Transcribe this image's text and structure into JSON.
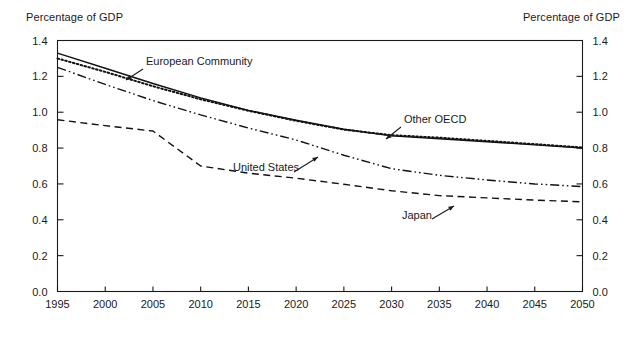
{
  "labels": {
    "ylabel_left": "Percentage of GDP",
    "ylabel_right": "Percentage of GDP"
  },
  "chart_data": {
    "type": "line",
    "title": "",
    "xlabel": "",
    "ylabel": "Percentage of GDP",
    "ylabel_right": "Percentage of GDP",
    "xlim": [
      1995,
      2050
    ],
    "ylim": [
      0.0,
      1.4
    ],
    "grid": false,
    "legend": "annotations-on-plot",
    "xticks": [
      1995,
      2000,
      2005,
      2010,
      2015,
      2020,
      2025,
      2030,
      2035,
      2040,
      2045,
      2050
    ],
    "xtick_labels": [
      "1995",
      "2000",
      "2005",
      "2010",
      "2015",
      "2020",
      "2025",
      "2030",
      "2035",
      "2040",
      "2045",
      "2050"
    ],
    "yticks": [
      0.0,
      0.2,
      0.4,
      0.6,
      0.8,
      1.0,
      1.2,
      1.4
    ],
    "ytick_labels": [
      "0.0",
      "0.2",
      "0.4",
      "0.6",
      "0.8",
      "1.0",
      "1.2",
      "1.4"
    ],
    "x": [
      1995,
      2000,
      2005,
      2010,
      2015,
      2020,
      2025,
      2030,
      2035,
      2040,
      2045,
      2050
    ],
    "series": [
      {
        "name": "European Community",
        "style": "solid",
        "values": [
          1.33,
          1.245,
          1.16,
          1.08,
          1.01,
          0.955,
          0.905,
          0.868,
          0.852,
          0.835,
          0.818,
          0.8
        ]
      },
      {
        "name": "Other OECD",
        "style": "dotted",
        "values": [
          1.3,
          1.225,
          1.145,
          1.072,
          1.008,
          0.952,
          0.903,
          0.872,
          0.858,
          0.84,
          0.822,
          0.803
        ]
      },
      {
        "name": "United States",
        "style": "dash-dot-dot",
        "values": [
          1.25,
          1.155,
          1.065,
          0.985,
          0.912,
          0.845,
          0.76,
          0.685,
          0.648,
          0.622,
          0.6,
          0.585
        ]
      },
      {
        "name": "Japan",
        "style": "dashed",
        "values": [
          0.958,
          0.925,
          0.895,
          0.7,
          0.66,
          0.632,
          0.598,
          0.562,
          0.535,
          0.522,
          0.51,
          0.5
        ]
      }
    ],
    "annotations": [
      {
        "text": "European Community",
        "label_x": 146,
        "label_y": 65,
        "arrow_from_x": 143,
        "arrow_from_y": 69,
        "arrow_to_x": 126,
        "arrow_to_y": 80,
        "series": "European Community"
      },
      {
        "text": "Other OECD",
        "label_x": 404,
        "label_y": 123,
        "arrow_from_x": 401,
        "arrow_from_y": 127,
        "arrow_to_x": 386,
        "arrow_to_y": 139,
        "series": "Other OECD"
      },
      {
        "text": "United States",
        "label_x": 233,
        "label_y": 171,
        "arrow_from_x": 294,
        "arrow_from_y": 172,
        "arrow_to_x": 318,
        "arrow_to_y": 157,
        "series": "United States"
      },
      {
        "text": "Japan",
        "label_x": 402,
        "label_y": 219,
        "arrow_from_x": 432,
        "arrow_from_y": 219,
        "arrow_to_x": 454,
        "arrow_to_y": 206,
        "series": "Japan"
      }
    ]
  }
}
